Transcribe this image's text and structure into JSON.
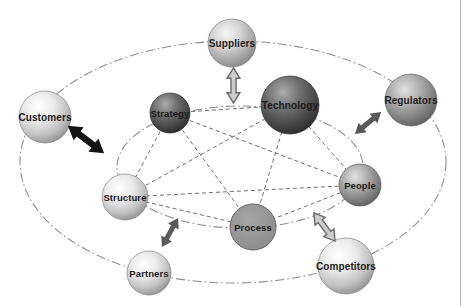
{
  "diagram": {
    "type": "organization-environment network diagram",
    "inner_nodes": [
      {
        "label": "Strategy",
        "tone": "dark"
      },
      {
        "label": "Technology",
        "tone": "dark"
      },
      {
        "label": "Structure",
        "tone": "light"
      },
      {
        "label": "People",
        "tone": "medium"
      },
      {
        "label": "Process",
        "tone": "flat-medium"
      }
    ],
    "outer_nodes": [
      {
        "label": "Suppliers",
        "tone": "light-medium"
      },
      {
        "label": "Customers",
        "tone": "light"
      },
      {
        "label": "Regulators",
        "tone": "medium"
      },
      {
        "label": "Partners",
        "tone": "light"
      },
      {
        "label": "Competitors",
        "tone": "light"
      }
    ],
    "orbits": [
      "inner dash-dot ellipse passing through the five inner nodes",
      "outer dash-dot ellipse passing through the five outer nodes"
    ],
    "inner_connections": "complete graph - every inner node joined to every other inner node by a dashed line",
    "arrows": [
      {
        "between": [
          "Customers",
          "Structure"
        ],
        "style": "solid-black-double-arrow"
      },
      {
        "between": [
          "Suppliers",
          "Technology"
        ],
        "style": "light-outlined-double-arrow"
      },
      {
        "between": [
          "Regulators",
          "People"
        ],
        "style": "solid-dark-gray-double-arrow"
      },
      {
        "between": [
          "Structure",
          "Partners"
        ],
        "style": "solid-dark-gray-double-arrow"
      },
      {
        "between": [
          "People",
          "Competitors"
        ],
        "style": "light-outlined-double-arrow"
      }
    ],
    "colors": {
      "background": "#ffffff",
      "orbit_line": "#8f8f8f",
      "connection_line": "#6e6e6e",
      "arrow_black": "#141414",
      "arrow_dark_gray": "#595959",
      "arrow_light_fill": "#cdcdcd",
      "arrow_outline": "#6a6a6a",
      "sphere_dark_edge": "#2a2a2a",
      "sphere_medium_edge": "#5e5e5e",
      "sphere_light_edge": "#8f8f8f",
      "process_fill": "#949494",
      "label_text": "#1c1c1c"
    }
  }
}
